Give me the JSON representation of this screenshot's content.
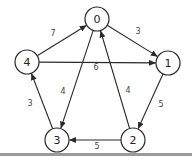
{
  "diagram": {
    "type": "directed-weighted-graph",
    "node_radius": 12,
    "colors": {
      "stroke": "#2a2a2a",
      "node_fill": "#ffffff",
      "label": "#222222",
      "weight": "#444444",
      "footer_bar": "#9a9a9a"
    },
    "nodes": [
      {
        "id": "0",
        "label": "0",
        "x": 97,
        "y": 19
      },
      {
        "id": "1",
        "label": "1",
        "x": 168,
        "y": 63
      },
      {
        "id": "2",
        "label": "2",
        "x": 133,
        "y": 140
      },
      {
        "id": "3",
        "label": "3",
        "x": 57,
        "y": 140
      },
      {
        "id": "4",
        "label": "4",
        "x": 27,
        "y": 62
      }
    ],
    "edges": [
      {
        "from": "4",
        "to": "0",
        "weight": "7",
        "label_x": 53,
        "label_y": 33
      },
      {
        "from": "0",
        "to": "1",
        "weight": "3",
        "label_x": 138,
        "label_y": 31
      },
      {
        "from": "4",
        "to": "1",
        "weight": "6",
        "label_x": 96,
        "label_y": 67
      },
      {
        "from": "0",
        "to": "3",
        "weight": "4",
        "label_x": 63,
        "label_y": 91
      },
      {
        "from": "2",
        "to": "0",
        "weight": "4",
        "label_x": 128,
        "label_y": 90
      },
      {
        "from": "1",
        "to": "2",
        "weight": "5",
        "label_x": 161,
        "label_y": 104
      },
      {
        "from": "2",
        "to": "3",
        "weight": "5",
        "label_x": 97,
        "label_y": 146
      },
      {
        "from": "3",
        "to": "4",
        "weight": "3",
        "label_x": 30,
        "label_y": 103
      }
    ]
  }
}
